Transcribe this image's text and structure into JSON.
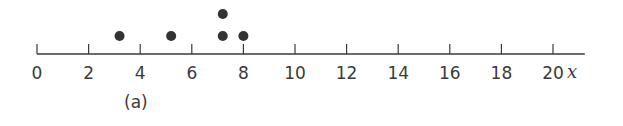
{
  "chart_data": {
    "type": "scatter",
    "subtype": "dot-plot",
    "title": "",
    "caption": "(a)",
    "xlabel": "x",
    "ylabel": "",
    "xlim": [
      0,
      21
    ],
    "x_ticks": [
      0,
      2,
      4,
      6,
      8,
      10,
      12,
      14,
      16,
      18,
      20
    ],
    "x_tick_labels": [
      "0",
      "2",
      "4",
      "6",
      "8",
      "10",
      "12",
      "14",
      "16",
      "18",
      "20"
    ],
    "points": [
      {
        "x": 3.2,
        "stack": 1
      },
      {
        "x": 5.2,
        "stack": 1
      },
      {
        "x": 7.2,
        "stack": 1
      },
      {
        "x": 7.2,
        "stack": 2
      },
      {
        "x": 8.0,
        "stack": 1
      }
    ],
    "values": [
      3.2,
      5.2,
      7.2,
      7.2,
      8.0
    ],
    "grid": false,
    "legend": null,
    "colors": {
      "axis": "#3a3a3a",
      "dot": "#333333"
    }
  }
}
